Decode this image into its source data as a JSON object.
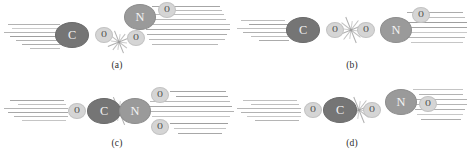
{
  "figure": {
    "atom_colors": {
      "C": "#757575",
      "N": "#9a9a9a",
      "O": "#d5d5d5",
      "speed_line": "#8d8d8d",
      "burst": "#9b9b9b",
      "background": "#ffffff"
    },
    "panels": [
      {
        "id": "panel-a",
        "caption": "(a)",
        "description": "Bent approach: C of CO attacks an O of NO2 from below",
        "atoms": [
          {
            "label": "C",
            "element": "C",
            "x": 72,
            "y": 35,
            "rx": 17,
            "ry": 13
          },
          {
            "label": "O",
            "element": "O",
            "x": 104,
            "y": 35,
            "rx": 9,
            "ry": 8
          },
          {
            "label": "N",
            "element": "N",
            "x": 140,
            "y": 17,
            "rx": 16,
            "ry": 13
          },
          {
            "label": "O",
            "element": "O",
            "x": 167,
            "y": 10,
            "rx": 9,
            "ry": 8
          },
          {
            "label": "O",
            "element": "O",
            "x": 136,
            "y": 38,
            "rx": 9,
            "ry": 8
          }
        ],
        "burst": {
          "x": 119,
          "y": 42,
          "size": 26
        },
        "speed_lines": [
          {
            "x": 8,
            "y": 24,
            "w": 52
          },
          {
            "x": 12,
            "y": 28,
            "w": 50
          },
          {
            "x": 4,
            "y": 32,
            "w": 58
          },
          {
            "x": 10,
            "y": 36,
            "w": 52
          },
          {
            "x": 16,
            "y": 40,
            "w": 46
          },
          {
            "x": 22,
            "y": 44,
            "w": 40
          },
          {
            "x": 30,
            "y": 48,
            "w": 30
          },
          {
            "x": 152,
            "y": 6,
            "w": 68
          },
          {
            "x": 160,
            "y": 10,
            "w": 62
          },
          {
            "x": 150,
            "y": 14,
            "w": 74
          },
          {
            "x": 148,
            "y": 19,
            "w": 78
          },
          {
            "x": 150,
            "y": 24,
            "w": 80
          },
          {
            "x": 146,
            "y": 29,
            "w": 84
          },
          {
            "x": 147,
            "y": 34,
            "w": 80
          },
          {
            "x": 149,
            "y": 39,
            "w": 76
          },
          {
            "x": 152,
            "y": 44,
            "w": 66
          }
        ]
      },
      {
        "id": "panel-b",
        "caption": "(b)",
        "description": "Collinear approach: C-O end-on toward O-N of NO2",
        "atoms": [
          {
            "label": "C",
            "element": "C",
            "x": 68,
            "y": 30,
            "rx": 17,
            "ry": 13
          },
          {
            "label": "O",
            "element": "O",
            "x": 100,
            "y": 30,
            "rx": 9,
            "ry": 8
          },
          {
            "label": "O",
            "element": "O",
            "x": 131,
            "y": 30,
            "rx": 9,
            "ry": 8
          },
          {
            "label": "N",
            "element": "N",
            "x": 161,
            "y": 30,
            "rx": 16,
            "ry": 13
          },
          {
            "label": "O",
            "element": "O",
            "x": 186,
            "y": 15,
            "rx": 9,
            "ry": 8
          }
        ],
        "burst": {
          "x": 116,
          "y": 30,
          "size": 30
        },
        "speed_lines": [
          {
            "x": 6,
            "y": 20,
            "w": 44
          },
          {
            "x": 14,
            "y": 24,
            "w": 40
          },
          {
            "x": 2,
            "y": 28,
            "w": 52
          },
          {
            "x": 8,
            "y": 32,
            "w": 46
          },
          {
            "x": 16,
            "y": 36,
            "w": 38
          },
          {
            "x": 24,
            "y": 40,
            "w": 30
          },
          {
            "x": 172,
            "y": 12,
            "w": 56
          },
          {
            "x": 178,
            "y": 17,
            "w": 52
          },
          {
            "x": 170,
            "y": 22,
            "w": 62
          },
          {
            "x": 168,
            "y": 27,
            "w": 64
          },
          {
            "x": 170,
            "y": 32,
            "w": 62
          },
          {
            "x": 172,
            "y": 37,
            "w": 58
          },
          {
            "x": 176,
            "y": 42,
            "w": 52
          }
        ]
      },
      {
        "id": "panel-c",
        "caption": "(c)",
        "description": "C of OC attacks N of NO2 directly; two O atoms on N",
        "atoms": [
          {
            "label": "O",
            "element": "O",
            "x": 77,
            "y": 33,
            "rx": 9,
            "ry": 8
          },
          {
            "label": "C",
            "element": "C",
            "x": 104,
            "y": 33,
            "rx": 17,
            "ry": 13
          },
          {
            "label": "N",
            "element": "N",
            "x": 135,
            "y": 33,
            "rx": 16,
            "ry": 13
          },
          {
            "label": "O",
            "element": "O",
            "x": 160,
            "y": 17,
            "rx": 9,
            "ry": 8
          },
          {
            "label": "O",
            "element": "O",
            "x": 160,
            "y": 49,
            "rx": 9,
            "ry": 8
          }
        ],
        "burst": {
          "x": 119,
          "y": 33,
          "size": 32
        },
        "speed_lines": [
          {
            "x": 10,
            "y": 22,
            "w": 54
          },
          {
            "x": 18,
            "y": 26,
            "w": 48
          },
          {
            "x": 4,
            "y": 30,
            "w": 64
          },
          {
            "x": 8,
            "y": 34,
            "w": 60
          },
          {
            "x": 14,
            "y": 38,
            "w": 54
          },
          {
            "x": 22,
            "y": 42,
            "w": 44
          },
          {
            "x": 170,
            "y": 13,
            "w": 56
          },
          {
            "x": 176,
            "y": 18,
            "w": 52
          },
          {
            "x": 150,
            "y": 23,
            "w": 80
          },
          {
            "x": 148,
            "y": 28,
            "w": 84
          },
          {
            "x": 150,
            "y": 33,
            "w": 84
          },
          {
            "x": 152,
            "y": 38,
            "w": 78
          },
          {
            "x": 170,
            "y": 45,
            "w": 58
          },
          {
            "x": 174,
            "y": 50,
            "w": 52
          },
          {
            "x": 178,
            "y": 55,
            "w": 44
          }
        ]
      },
      {
        "id": "panel-d",
        "caption": "(d)",
        "description": "Side-on approach of OC toward the O-N-O axis",
        "atoms": [
          {
            "label": "O",
            "element": "O",
            "x": 78,
            "y": 32,
            "rx": 9,
            "ry": 8
          },
          {
            "label": "C",
            "element": "C",
            "x": 105,
            "y": 32,
            "rx": 17,
            "ry": 13
          },
          {
            "label": "O",
            "element": "O",
            "x": 137,
            "y": 32,
            "rx": 9,
            "ry": 8
          },
          {
            "label": "N",
            "element": "N",
            "x": 166,
            "y": 24,
            "rx": 16,
            "ry": 13
          },
          {
            "label": "O",
            "element": "O",
            "x": 193,
            "y": 26,
            "rx": 9,
            "ry": 8
          }
        ],
        "burst": {
          "x": 124,
          "y": 32,
          "size": 30
        },
        "speed_lines": [
          {
            "x": 8,
            "y": 22,
            "w": 54
          },
          {
            "x": 16,
            "y": 26,
            "w": 48
          },
          {
            "x": 2,
            "y": 30,
            "w": 64
          },
          {
            "x": 6,
            "y": 34,
            "w": 60
          },
          {
            "x": 12,
            "y": 38,
            "w": 54
          },
          {
            "x": 20,
            "y": 42,
            "w": 44
          },
          {
            "x": 178,
            "y": 11,
            "w": 50
          },
          {
            "x": 184,
            "y": 16,
            "w": 44
          },
          {
            "x": 176,
            "y": 21,
            "w": 56
          },
          {
            "x": 178,
            "y": 26,
            "w": 54
          },
          {
            "x": 180,
            "y": 31,
            "w": 50
          },
          {
            "x": 182,
            "y": 36,
            "w": 46
          },
          {
            "x": 186,
            "y": 41,
            "w": 40
          }
        ]
      }
    ]
  }
}
